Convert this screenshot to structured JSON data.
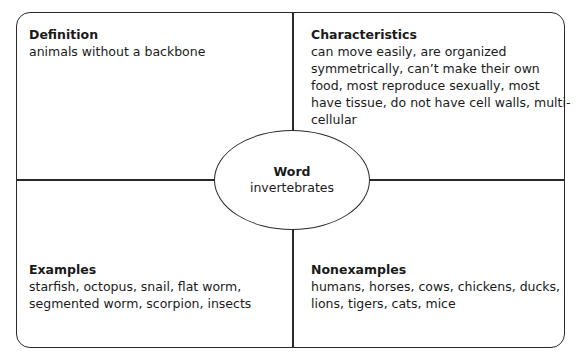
{
  "diagram": {
    "type": "frayer-model",
    "center": {
      "title": "Word",
      "text": "invertebrates"
    },
    "quadrants": {
      "definition": {
        "title": "Definition",
        "text": "animals without a backbone"
      },
      "characteristics": {
        "title": "Characteristics",
        "text": "can move easily, are organized symmetrically, can’t make their own food, most reproduce sexually, most have tissue, do not have cell walls, multi-cellular"
      },
      "examples": {
        "title": "Examples",
        "text": "starfish, octopus, snail, flat worm, segmented worm, scorpion, insects"
      },
      "nonexamples": {
        "title": "Nonexamples",
        "text": "humans, horses, cows, chickens, ducks, lions, tigers, cats, mice"
      }
    },
    "colors": {
      "line": "#2a2a2a",
      "text": "#1a1a1a",
      "background": "#ffffff"
    }
  }
}
